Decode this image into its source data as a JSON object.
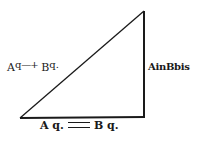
{
  "diagram": {
    "type": "right-triangle",
    "vertices": {
      "top": [
        144,
        11
      ],
      "bottom_right": [
        144,
        117
      ],
      "bottom_left": [
        20,
        118
      ]
    },
    "stroke_color": "#1a1a1a",
    "labels": {
      "hypotenuse": {
        "term1_base": "A",
        "term1_exp": "q",
        "operator": "—+",
        "term2_base": "B",
        "term2_exp": "q."
      },
      "vertical_side": {
        "text": "AinBbis"
      },
      "base": {
        "term1": "A q.",
        "operator": "minus",
        "term2": "B q."
      }
    }
  }
}
